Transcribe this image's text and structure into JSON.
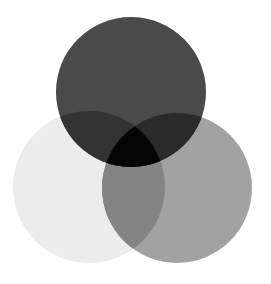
{
  "diagram": {
    "type": "venn-3",
    "background": "#ffffff",
    "circles": [
      {
        "id": "top",
        "cx": 131,
        "cy": 92,
        "r": 75,
        "color": "#4a4a4a"
      },
      {
        "id": "left",
        "cx": 89,
        "cy": 187,
        "r": 76,
        "color": "#ececec"
      },
      {
        "id": "right",
        "cx": 177,
        "cy": 188,
        "r": 75,
        "color": "#a2a2a2"
      }
    ],
    "regions": {
      "top_left": "#333333",
      "top_right": "#2a2a2a",
      "left_right": "#848484",
      "all": "#050505"
    }
  }
}
